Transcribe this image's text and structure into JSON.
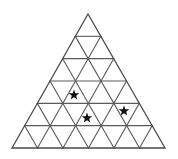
{
  "figure": {
    "type": "triangular-grid",
    "background_color": "#ffffff",
    "line_color": "#5a5a5a",
    "outline_color": "#4a4a4a",
    "star_color": "#111111",
    "rows": 6,
    "small_triangle_count": 36,
    "apex": {
      "x": 88,
      "y": 14
    },
    "base_left": {
      "x": 12,
      "y": 148
    },
    "base_right": {
      "x": 165,
      "y": 148
    },
    "row_y": [
      14,
      40.7,
      67.4,
      94.1,
      120.8,
      148
    ],
    "stars": [
      {
        "label": "star-1",
        "x": 74,
        "y": 95,
        "size": 11,
        "row": 5,
        "cell": 3
      },
      {
        "label": "star-2",
        "x": 87,
        "y": 118,
        "size": 11,
        "row": 6,
        "cell": 6
      },
      {
        "label": "star-3",
        "x": 124,
        "y": 111,
        "size": 11,
        "row": 5,
        "cell": 8
      }
    ]
  }
}
